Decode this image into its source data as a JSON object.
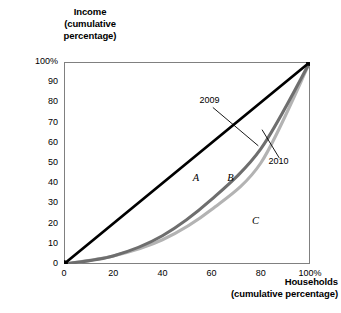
{
  "chart_data": {
    "type": "line",
    "title": "",
    "xlabel": "Households (cumulative percentage)",
    "ylabel": "Income (cumulative percentage)",
    "xlim": [
      0,
      100
    ],
    "ylim": [
      0,
      100
    ],
    "grid": false,
    "legend_position": "inline-callout",
    "x_ticks": [
      "0",
      "20",
      "40",
      "60",
      "80",
      "100%"
    ],
    "y_ticks": [
      "0",
      "10",
      "20",
      "30",
      "40",
      "50",
      "60",
      "70",
      "80",
      "90",
      "100%"
    ],
    "x_tick_values": [
      0,
      20,
      40,
      60,
      80,
      100
    ],
    "y_tick_values": [
      0,
      10,
      20,
      30,
      40,
      50,
      60,
      70,
      80,
      90,
      100
    ],
    "x": [
      0,
      20,
      40,
      60,
      80,
      100
    ],
    "series": [
      {
        "name": "Line of equality",
        "color": "#000000",
        "values": [
          0,
          20,
          40,
          60,
          80,
          100
        ],
        "markers": [
          0,
          100
        ]
      },
      {
        "name": "2009",
        "color": "#6e6e6e",
        "values": [
          0,
          4,
          14,
          32,
          57,
          100
        ],
        "markers": [
          0,
          4,
          14,
          32,
          57,
          100
        ]
      },
      {
        "name": "2010",
        "color": "#b3b3b3",
        "values": [
          0,
          4,
          12,
          27,
          50,
          100
        ],
        "markers": [
          0,
          4,
          12,
          27,
          50,
          100
        ]
      }
    ],
    "annotations": [
      {
        "text": "2009",
        "x": 60,
        "y": 80,
        "target_x": 80,
        "target_y": 57
      },
      {
        "text": "2010",
        "x": 88,
        "y": 50,
        "target_x": 80,
        "target_y": 66
      },
      {
        "text": "A",
        "x": 54,
        "y": 42,
        "kind": "region"
      },
      {
        "text": "B",
        "x": 68,
        "y": 42,
        "kind": "region"
      },
      {
        "text": "C",
        "x": 78,
        "y": 21,
        "kind": "region"
      }
    ]
  },
  "axes": {
    "y_title_lines": [
      "Income",
      "(cumulative",
      "percentage)"
    ],
    "x_title_lines": [
      "Households",
      "(cumulative percentage)"
    ]
  },
  "colors": {
    "equality_line": "#000000",
    "series_2009": "#6e6e6e",
    "series_2010": "#b3b3b3",
    "axis": "#808080",
    "marker": "#000000",
    "text": "#000000"
  }
}
